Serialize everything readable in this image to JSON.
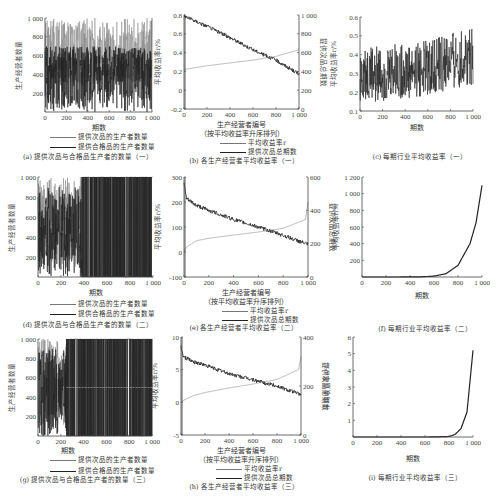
{
  "figure": {
    "panels_count": 9
  },
  "chart_data": [
    {
      "id": "a",
      "type": "line",
      "caption": "(a) 提供次品与合格品生产者的数量（一）",
      "title": "",
      "xlabel": "期数",
      "ylabel": "生产经营者数量",
      "xlim": [
        0,
        1000
      ],
      "ylim": [
        0,
        1000
      ],
      "xticks": [
        "0",
        "200",
        "400",
        "600",
        "800",
        "1 000"
      ],
      "yticks": [
        "200",
        "400",
        "600",
        "800",
        "1 000"
      ],
      "legend": [
        "提供次品的生产者数量",
        "提供合格品的生产者数量"
      ],
      "legend_position": "below",
      "series": [
        {
          "name": "提供次品的生产者数量",
          "color": "#888888",
          "pattern": "oscillating between ~50 and ~1000, dense",
          "approx_mean": 700
        },
        {
          "name": "提供合格品的生产者数量",
          "color": "#222222",
          "pattern": "oscillating between ~0 and ~950, dense",
          "approx_mean": 300
        }
      ],
      "grid": false
    },
    {
      "id": "b",
      "type": "line",
      "caption": "(b) 各生产经营者平均收益率（一）",
      "xlabel": "生产经营者编号",
      "xlabel2": "（按平均收益率升序排列）",
      "ylabel": "平均收益率r/%",
      "ylabel_right": "提供次品总期数",
      "xlim": [
        0,
        1000
      ],
      "ylim": [
        -0.2,
        0.8
      ],
      "ylim_right": [
        0,
        1000
      ],
      "xticks": [
        "0",
        "200",
        "400",
        "600",
        "800",
        "1 000"
      ],
      "yticks": [
        "-0.2",
        "0",
        "0.2",
        "0.4",
        "0.6",
        "0.8"
      ],
      "yticks_right": [
        "0",
        "200",
        "400",
        "600",
        "800",
        "1 000"
      ],
      "legend": [
        "平均收益率r",
        "提供次品总期数"
      ],
      "series": [
        {
          "name": "平均收益率r",
          "color": "#888888",
          "axis": "left",
          "x": [
            0,
            200,
            400,
            600,
            800,
            1000
          ],
          "values": [
            0.22,
            0.26,
            0.29,
            0.32,
            0.36,
            0.43
          ]
        },
        {
          "name": "提供次品总期数",
          "color": "#222222",
          "axis": "right",
          "x": [
            0,
            200,
            400,
            600,
            800,
            1000
          ],
          "values": [
            990,
            880,
            760,
            630,
            520,
            370
          ]
        }
      ],
      "grid": false
    },
    {
      "id": "c",
      "type": "line",
      "caption": "(c) 每期行业平均收益率（一）",
      "xlabel": "期数",
      "ylabel": "平均收益率r/%",
      "xlim": [
        0,
        1000
      ],
      "ylim": [
        0.1,
        0.6
      ],
      "xticks": [
        "0",
        "200",
        "400",
        "600",
        "800",
        "1 000"
      ],
      "yticks": [
        "0.1",
        "0.2",
        "0.3",
        "0.4",
        "0.5",
        "0.6"
      ],
      "series": [
        {
          "name": "每期行业平均收益率",
          "color": "#222222",
          "x": [
            0,
            200,
            400,
            600,
            800,
            1000
          ],
          "lower": [
            0.14,
            0.15,
            0.16,
            0.18,
            0.21,
            0.24
          ],
          "upper": [
            0.44,
            0.45,
            0.46,
            0.48,
            0.52,
            0.54
          ]
        }
      ],
      "grid": false
    },
    {
      "id": "d",
      "type": "line",
      "caption": "(d) 提供次品与合格品生产者的数量（二）",
      "xlabel": "期数",
      "ylabel": "生产经营者数量",
      "xlim": [
        0,
        1000
      ],
      "ylim": [
        0,
        1000
      ],
      "xticks": [
        "0",
        "200",
        "400",
        "600",
        "800",
        "1 000"
      ],
      "yticks": [
        "200",
        "400",
        "600",
        "800",
        "1 000"
      ],
      "legend": [
        "提供次品的生产者数量",
        "提供合格品的生产者数量"
      ],
      "series": [
        {
          "name": "提供次品的生产者数量",
          "color": "#888888",
          "pattern": "dense oscillation early, switching between 0 and 1000 later"
        },
        {
          "name": "提供合格品的生产者数量",
          "color": "#222222",
          "pattern": "dense oscillation early, switching between 0 and 1000 later"
        }
      ],
      "grid": false
    },
    {
      "id": "e",
      "type": "line",
      "caption": "(e) 各生产经营者平均收益率（二）",
      "xlabel": "生产经营者编号",
      "xlabel2": "（按平均收益率升序排列）",
      "ylabel": "平均收益率r/%",
      "ylabel_right": "提供次品总期数",
      "xlim": [
        0,
        1000
      ],
      "ylim": [
        -100,
        300
      ],
      "ylim_right": [
        0,
        600
      ],
      "xticks": [
        "0",
        "200",
        "400",
        "600",
        "800",
        "1 000"
      ],
      "yticks": [
        "-100",
        "0",
        "100",
        "200",
        "300"
      ],
      "yticks_right": [
        "0",
        "200",
        "400",
        "600"
      ],
      "legend": [
        "平均收益率r",
        "提供次品总期数"
      ],
      "series": [
        {
          "name": "平均收益率r",
          "color": "#888888",
          "axis": "left",
          "x": [
            0,
            20,
            100,
            200,
            400,
            600,
            800,
            980,
            1000
          ],
          "values": [
            0,
            20,
            45,
            55,
            68,
            80,
            95,
            130,
            200
          ]
        },
        {
          "name": "提供次品总期数",
          "color": "#222222",
          "axis": "right",
          "x": [
            0,
            20,
            100,
            200,
            400,
            600,
            800,
            1000
          ],
          "values": [
            560,
            470,
            430,
            400,
            345,
            300,
            250,
            195
          ]
        }
      ],
      "grid": false
    },
    {
      "id": "f",
      "type": "line",
      "caption": "(f) 每期行业平均收益率（二）",
      "xlabel": "期数",
      "ylabel": "平均收益率r/%",
      "xlim": [
        0,
        1000
      ],
      "ylim": [
        0,
        1200
      ],
      "xticks": [
        "0",
        "200",
        "400",
        "600",
        "800",
        "1 000"
      ],
      "yticks": [
        "200",
        "400",
        "600",
        "800",
        "1 000",
        "1 200"
      ],
      "series": [
        {
          "name": "每期行业平均收益率",
          "color": "#222222",
          "x": [
            0,
            200,
            400,
            500,
            600,
            700,
            800,
            900,
            950,
            1000
          ],
          "values": [
            0,
            0,
            1,
            3,
            10,
            40,
            140,
            400,
            650,
            1100
          ]
        }
      ],
      "grid": false
    },
    {
      "id": "g",
      "type": "line",
      "caption": "(g) 提供次品与合格品生产者的数量（三）",
      "xlabel": "期数",
      "ylabel": "生产经营者数量",
      "xlim": [
        0,
        1000
      ],
      "ylim": [
        0,
        1000
      ],
      "xticks": [
        "0",
        "200",
        "400",
        "600",
        "800",
        "1 000"
      ],
      "yticks": [
        "200",
        "400",
        "600",
        "800",
        "1 000"
      ],
      "legend": [
        "提供次品的生产者数量",
        "提供合格品的生产者数量"
      ],
      "series": [
        {
          "name": "提供次品的生产者数量",
          "color": "#888888",
          "pattern": "dense oscillation before ~250, then switches between 0 and 1000; dashed level near 500"
        },
        {
          "name": "提供合格品的生产者数量",
          "color": "#222222",
          "pattern": "dense oscillation before ~250, then switches between 0 and 1000"
        }
      ],
      "grid": false
    },
    {
      "id": "h",
      "type": "line",
      "caption": "(h) 各生产经营者平均收益率（三）",
      "xlabel": "生产经营者编号",
      "xlabel2": "（按平均收益率升序排列）",
      "ylabel": "平均收益率r/%",
      "ylabel_right": "提供次品总期数",
      "xlim": [
        0,
        1000
      ],
      "ylim": [
        -5,
        10
      ],
      "ylim_right": [
        0,
        400
      ],
      "xticks": [
        "0",
        "200",
        "400",
        "600",
        "800",
        "1 000"
      ],
      "yticks": [
        "-5",
        "0",
        "5",
        "10"
      ],
      "yticks_right": [
        "0",
        "200",
        "400"
      ],
      "legend": [
        "平均收益率r",
        "提供次品总期数"
      ],
      "series": [
        {
          "name": "平均收益率r",
          "color": "#888888",
          "axis": "left",
          "x": [
            0,
            20,
            100,
            200,
            400,
            600,
            800,
            980,
            1000
          ],
          "values": [
            0,
            0.3,
            1.0,
            1.5,
            2.2,
            2.8,
            3.5,
            5.0,
            7.0
          ]
        },
        {
          "name": "提供次品总期数",
          "color": "#222222",
          "axis": "right",
          "x": [
            0,
            20,
            100,
            200,
            400,
            600,
            800,
            1000
          ],
          "values": [
            360,
            320,
            300,
            285,
            250,
            225,
            200,
            165
          ]
        }
      ],
      "grid": false
    },
    {
      "id": "i",
      "type": "line",
      "caption": "(i) 每期行业平均收益率（三）",
      "xlabel": "期数",
      "ylabel": "平均收益率r/%",
      "xlim": [
        0,
        1000
      ],
      "ylim": [
        0,
        6
      ],
      "xticks": [
        "0",
        "200",
        "400",
        "600",
        "800",
        "1 000"
      ],
      "yticks": [
        "1",
        "2",
        "3",
        "4",
        "5",
        "6"
      ],
      "series": [
        {
          "name": "每期行业平均收益率",
          "color": "#222222",
          "x": [
            0,
            200,
            400,
            600,
            700,
            800,
            850,
            900,
            950,
            1000
          ],
          "values": [
            0,
            0,
            0,
            0,
            0.01,
            0.03,
            0.15,
            0.5,
            1.5,
            5.2
          ]
        }
      ],
      "grid": false
    }
  ]
}
